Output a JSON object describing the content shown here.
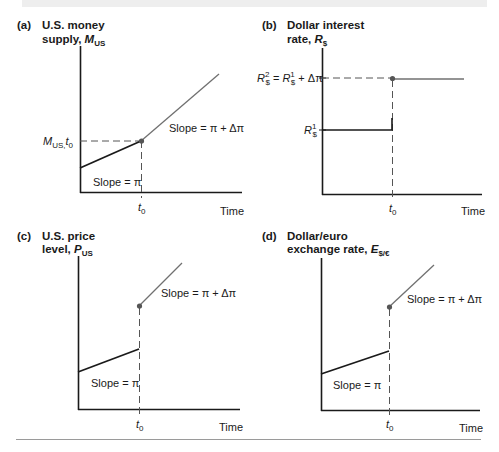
{
  "colors": {
    "axis": "#1a1a1a",
    "initial_line": "#1a1a1a",
    "new_line": "#707070",
    "dashed": "#555555",
    "point": "#555555",
    "top_band": "#eeeeee",
    "bottom_rule": "#9a9a9a"
  },
  "panels": {
    "a": {
      "tag": "(a)",
      "title_line1": "U.S. money",
      "title_line2_prefix": "supply, ",
      "var_symbol": "M",
      "var_sub": "US",
      "y_marker_symbol": "M",
      "y_marker_sub": "US,",
      "y_marker_t": "t",
      "y_marker_t_sub": "0",
      "slope_before": "Slope = π",
      "slope_after": "Slope = π + Δπ",
      "x_tick": "t",
      "x_tick_sub": "0",
      "x_label": "Time"
    },
    "b": {
      "tag": "(b)",
      "title_line1": "Dollar interest",
      "title_line2_prefix": "rate, ",
      "var_symbol": "R",
      "var_sub": "$",
      "upper_label_lhs_symbol": "R",
      "upper_label_lhs_sup": "2",
      "upper_label_lhs_sub": "$",
      "upper_label_eq": " = ",
      "upper_label_rhs_symbol": "R",
      "upper_label_rhs_sup": "1",
      "upper_label_rhs_sub": "$",
      "upper_label_rhs_tail": " + Δπ",
      "lower_label_symbol": "R",
      "lower_label_sup": "1",
      "lower_label_sub": "$",
      "x_tick": "t",
      "x_tick_sub": "0",
      "x_label": "Time"
    },
    "c": {
      "tag": "(c)",
      "title_line1": "U.S. price",
      "title_line2_prefix": "level, ",
      "var_symbol": "P",
      "var_sub": "US",
      "slope_before": "Slope = π",
      "slope_after": "Slope = π + Δπ",
      "x_tick": "t",
      "x_tick_sub": "0",
      "x_label": "Time"
    },
    "d": {
      "tag": "(d)",
      "title_line1": "Dollar/euro",
      "title_line2_prefix": "exchange rate, ",
      "var_symbol": "E",
      "var_sub": "$/€",
      "slope_before": "Slope = π",
      "slope_after": "Slope = π + Δπ",
      "x_tick": "t",
      "x_tick_sub": "0",
      "x_label": "Time"
    }
  }
}
